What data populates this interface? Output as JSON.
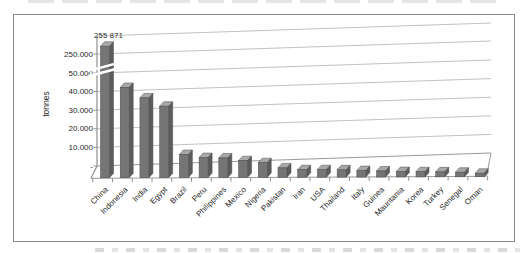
{
  "chart_data": {
    "type": "bar",
    "title": "",
    "ylabel": "tonnes",
    "categories": [
      "China",
      "Indonesia",
      "India",
      "Egypt",
      "Brazil",
      "Peru",
      "Philippines",
      "Mexico",
      "Nigeria",
      "Pakistan",
      "Iran",
      "USA",
      "Thailand",
      "Italy",
      "Guinea",
      "Mauritania",
      "Korea",
      "Turkey",
      "Senegal",
      "Oman"
    ],
    "values": [
      255871,
      43000,
      38000,
      34000,
      11000,
      9500,
      9300,
      8000,
      7000,
      4500,
      3600,
      3600,
      3500,
      3100,
      2900,
      2600,
      2500,
      2400,
      2200,
      1700
    ],
    "annotation": {
      "category": "China",
      "text": "255 871",
      "value": 255871
    },
    "y_axis": {
      "tick_labels_top_to_bottom": [
        "250.000",
        "50.000",
        "40.000",
        "30.000",
        "20.000",
        "10.000",
        "-"
      ],
      "unit_step": 10000,
      "has_break": true,
      "break_between": [
        "50.000",
        "250.000"
      ]
    },
    "x_axis": {
      "label_rotation_deg": -45
    },
    "legend": false,
    "grid": true,
    "colors": {
      "bar_front": "#757575",
      "bar_side": "#5c5c5c",
      "bar_top": "#a8a8a8",
      "bar_outline": "#4a4a4a",
      "gridline": "#c2c2c2",
      "axis": "#8f8f8f",
      "frame_border": "#8a8a8a",
      "text": "#1f1f1f",
      "background": "#ffffff"
    }
  }
}
